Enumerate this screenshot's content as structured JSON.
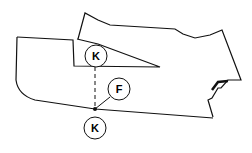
{
  "diagram": {
    "type": "pattern-piece-illustration",
    "labels": {
      "k_top": "K",
      "f_mid": "F",
      "k_bottom": "K"
    },
    "colors": {
      "stroke": "#111111",
      "background": "#ffffff"
    }
  }
}
